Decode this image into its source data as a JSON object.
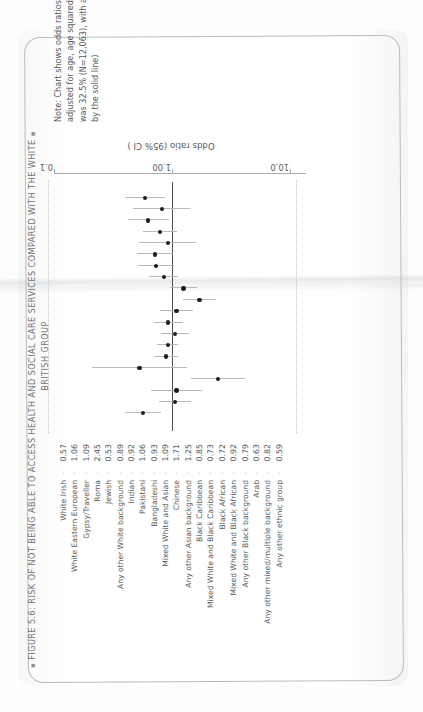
{
  "figure": {
    "bullet": "▪",
    "title_line1": "FIGURE 5.6: RISK OF NOT BEING ABLE TO ACCESS HEALTH AND SOCIAL CARE SERVICES COMPARED WITH THE WHITE",
    "title_line2": "BRITISH GROUP",
    "note": "Note: Chart shows odds ratios with 95% confidence intervals, adjusted for age, age squared and sex. The White British rate was 32.5% (N=12,063), with an odds ratio of 1 (represented by the solid line)"
  },
  "axis": {
    "title": "Odds ratio (95% CI )",
    "ticks": [
      "0.1",
      "1.00",
      "10.0"
    ],
    "tick_values": [
      0.1,
      1.0,
      10.0
    ],
    "leader_dot": "·"
  },
  "colors": {
    "marker": "#1c1d1e",
    "whisker": "#b7babc",
    "refline": "#4c4f51",
    "axis": "#a9acae",
    "text": "#56595b",
    "dotted_rule": "#c2c5c7",
    "paper": "#fdfdfd"
  },
  "chart_data": {
    "type": "scatter",
    "xlabel": "Odds ratio (95% CI )",
    "ylabel": "",
    "xscale": "log",
    "xlim": [
      0.1,
      10.0
    ],
    "xticks": [
      0.1,
      1.0,
      10.0
    ],
    "xticklabels": [
      "0.1",
      "1.00",
      "10.0"
    ],
    "grid": false,
    "legend": "none",
    "reference_line": 1.0,
    "categories": [
      "White Irish",
      "White Eastern European",
      "Gypsy/Traveller",
      "Roma",
      "Jewish",
      "Any other White background",
      "Indian",
      "Pakistani",
      "Bangladeshi",
      "Mixed White and Asian",
      "Chinese",
      "Any other Asian background",
      "Black Caribbean",
      "Mixed White and Black Caribbean",
      "Black African",
      "Mixed White and Black African",
      "Any other Black background",
      "Arab",
      "Any other mixed/multiple background",
      "Any other ethnic group"
    ],
    "values": [
      0.57,
      1.06,
      1.09,
      2.45,
      0.53,
      0.89,
      0.92,
      1.06,
      0.93,
      1.09,
      1.71,
      1.25,
      0.85,
      0.73,
      0.72,
      0.92,
      0.79,
      0.63,
      0.82,
      0.59
    ],
    "ci_low": [
      0.4,
      0.78,
      0.67,
      1.44,
      0.21,
      0.71,
      0.75,
      0.8,
      0.7,
      0.79,
      1.24,
      0.96,
      0.64,
      0.52,
      0.51,
      0.53,
      0.57,
      0.42,
      0.47,
      0.4
    ],
    "ci_high": [
      0.81,
      1.44,
      1.78,
      4.17,
      1.33,
      1.12,
      1.13,
      1.4,
      1.24,
      1.5,
      2.36,
      1.62,
      1.13,
      1.03,
      1.02,
      1.6,
      1.1,
      0.94,
      1.43,
      0.87
    ],
    "series": [
      {
        "name": "Odds ratio",
        "values": [
          0.57,
          1.06,
          1.09,
          2.45,
          0.53,
          0.89,
          0.92,
          1.06,
          0.93,
          1.09,
          1.71,
          1.25,
          0.85,
          0.73,
          0.72,
          0.92,
          0.79,
          0.63,
          0.82,
          0.59
        ]
      }
    ]
  }
}
